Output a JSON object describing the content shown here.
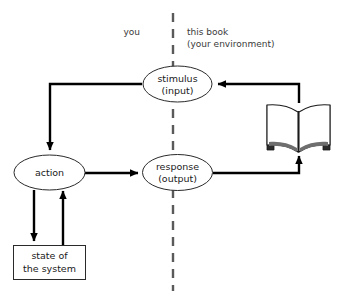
{
  "figure": {
    "background_color": "#ffffff",
    "line_color": "#000000",
    "divider_color": "#5a5a5a",
    "caption": ""
  },
  "side_labels": {
    "left": "you",
    "right_line1": "this book",
    "right_line2": "(your environment)"
  },
  "nodes": {
    "stimulus": {
      "line1": "stimulus",
      "line2": "(input)",
      "shape": "ellipse"
    },
    "action": {
      "line1": "action",
      "line2": "",
      "shape": "ellipse"
    },
    "response": {
      "line1": "response",
      "line2": "(output)",
      "shape": "ellipse"
    },
    "state": {
      "line1": "state of",
      "line2": "the system",
      "shape": "rectangle"
    },
    "book": {
      "label": "open-book-icon",
      "shape": "icon"
    }
  },
  "edges": [
    {
      "name": "stimulus-to-action",
      "from": "stimulus",
      "to": "action"
    },
    {
      "name": "action-to-response",
      "from": "action",
      "to": "response"
    },
    {
      "name": "action-to-state",
      "from": "action",
      "to": "state"
    },
    {
      "name": "state-to-action",
      "from": "state",
      "to": "action"
    },
    {
      "name": "response-to-book",
      "from": "response",
      "to": "book"
    },
    {
      "name": "book-to-stimulus",
      "from": "book",
      "to": "stimulus"
    }
  ]
}
